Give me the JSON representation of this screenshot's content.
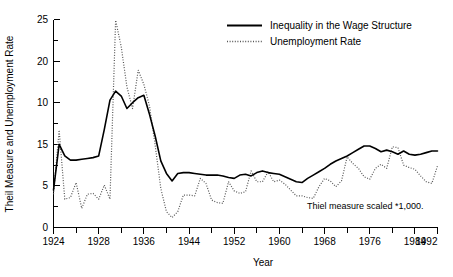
{
  "chart_data": {
    "type": "line",
    "title": "",
    "xlabel": "Year",
    "ylabel": "Theil Measure and Unemployment Rate",
    "xlim": [
      1924,
      1992
    ],
    "ylim": [
      0,
      25
    ],
    "grid": false,
    "legend_position": "top-right",
    "annotation": "Thiel measure scaled *1,000.",
    "xticks": [
      1924,
      1928,
      1932,
      1936,
      1940,
      1944,
      1948,
      1952,
      1956,
      1960,
      1964,
      1968,
      1972,
      1976,
      1980,
      1984,
      1988,
      1992
    ],
    "xticklabels": [
      "1924",
      "1928",
      "",
      "1936",
      "",
      "1944",
      "",
      "1952",
      "",
      "1960",
      "",
      "1968",
      "",
      "1976",
      "",
      "1984",
      "",
      "1992"
    ],
    "yticks": [
      0,
      2.5,
      5,
      7.5,
      10,
      12.5,
      15,
      17.5,
      20,
      22.5,
      25
    ],
    "yticklabels": [
      "0",
      "",
      "5",
      "",
      "10",
      "",
      "15",
      "",
      "20",
      "",
      "25"
    ],
    "x": [
      1924,
      1925,
      1926,
      1927,
      1928,
      1929,
      1930,
      1931,
      1932,
      1933,
      1934,
      1935,
      1936,
      1937,
      1938,
      1939,
      1940,
      1941,
      1942,
      1943,
      1944,
      1945,
      1946,
      1947,
      1948,
      1949,
      1950,
      1951,
      1952,
      1953,
      1954,
      1955,
      1956,
      1957,
      1958,
      1959,
      1960,
      1961,
      1962,
      1963,
      1964,
      1965,
      1966,
      1967,
      1968,
      1969,
      1970,
      1971,
      1972,
      1973,
      1974,
      1975,
      1976,
      1977,
      1978,
      1979,
      1980,
      1981,
      1982,
      1983,
      1984,
      1985,
      1986,
      1987,
      1988,
      1989,
      1990,
      1991,
      1992
    ],
    "series": [
      {
        "name": "Inequality in the Wage Structure",
        "style": "solid",
        "color": "#000000",
        "values": [
          4.5,
          10.0,
          8.6,
          8.1,
          8.1,
          8.2,
          8.3,
          8.4,
          8.6,
          11.8,
          15.3,
          16.4,
          15.8,
          14.3,
          15.0,
          15.6,
          15.9,
          13.6,
          11.0,
          8.0,
          6.5,
          5.6,
          6.5,
          6.6,
          6.6,
          6.5,
          6.4,
          6.3,
          6.3,
          6.3,
          6.2,
          6.0,
          5.9,
          6.3,
          6.4,
          6.2,
          6.6,
          6.8,
          6.6,
          6.5,
          6.4,
          6.1,
          5.8,
          5.5,
          5.4,
          5.9,
          6.3,
          6.7,
          7.1,
          7.6,
          8.0,
          8.3,
          8.6,
          9.0,
          9.4,
          9.8,
          9.8,
          9.5,
          9.1,
          9.3,
          9.1,
          8.8,
          9.2,
          8.8,
          8.7,
          8.8,
          9.0,
          9.2,
          9.2
        ]
      },
      {
        "name": "Unemployment Rate",
        "style": "dotted",
        "color": "#555555",
        "values": [
          4.0,
          11.7,
          3.4,
          3.6,
          5.4,
          2.3,
          4.0,
          4.1,
          3.4,
          5.1,
          3.4,
          24.9,
          21.7,
          16.9,
          14.3,
          18.9,
          17.2,
          14.6,
          9.9,
          4.7,
          1.9,
          1.2,
          1.9,
          3.9,
          3.9,
          3.8,
          5.9,
          5.3,
          3.3,
          3.0,
          2.9,
          5.5,
          4.4,
          4.1,
          4.3,
          6.8,
          5.5,
          5.5,
          6.7,
          5.5,
          5.7,
          5.2,
          4.5,
          3.8,
          3.8,
          3.6,
          3.5,
          4.9,
          5.9,
          5.6,
          4.9,
          5.6,
          8.5,
          7.7,
          7.1,
          6.1,
          5.8,
          7.1,
          7.6,
          7.1,
          9.7,
          9.6,
          7.5,
          7.2,
          7.0,
          6.2,
          5.5,
          5.3,
          7.4
        ]
      }
    ]
  },
  "axis": {
    "y_label": "Theil Measure and Unemployment Rate",
    "x_label": "Year",
    "y_tick_0": "0",
    "y_tick_5": "5",
    "y_tick_10": "10",
    "y_tick_15": "15",
    "y_tick_20": "20",
    "y_tick_25": "25",
    "x_tick_1924": "1924",
    "x_tick_1928": "1928",
    "x_tick_1936": "1936",
    "x_tick_1944": "1944",
    "x_tick_1952": "1952",
    "x_tick_1960": "1960",
    "x_tick_1968": "1968",
    "x_tick_1976": "1976",
    "x_tick_1984": "1984",
    "x_tick_1992": "1992"
  },
  "legend": {
    "entry_solid": "Inequality in the Wage Structure",
    "entry_dotted": "Unemployment Rate"
  },
  "note": {
    "text": "Thiel measure scaled *1,000."
  }
}
